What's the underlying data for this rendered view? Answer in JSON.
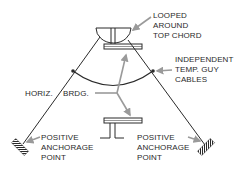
{
  "diagram": {
    "labels": {
      "looped": [
        "LOOPED",
        "AROUND",
        "TOP CHORD"
      ],
      "independent": [
        "INDEPENDENT",
        "TEMP. GUY",
        "CABLES"
      ],
      "horiz_left": "HORIZ.",
      "horiz_right": "BRDG.",
      "anchor_left": [
        "POSITIVE",
        "ANCHORAGE",
        "POINT"
      ],
      "anchor_right": [
        "POSITIVE",
        "ANCHORAGE",
        "POINT"
      ]
    },
    "colors": {
      "line": "#2a2a2a",
      "arrow": "#9a9a9a",
      "text": "#2a2a2a",
      "background": "#ffffff"
    }
  }
}
